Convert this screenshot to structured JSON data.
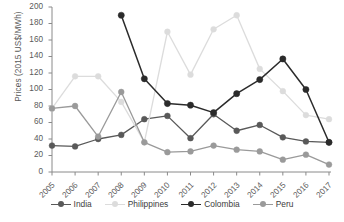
{
  "chart_data": {
    "type": "line",
    "title": "",
    "subtitle": "",
    "xlabel": "",
    "ylabel": "Prices (2015 US$/MWh)",
    "categories": [
      "2005",
      "2006",
      "2007",
      "2008",
      "2009",
      "2010",
      "2011",
      "2012",
      "2013",
      "2014",
      "2015",
      "2016",
      "2017"
    ],
    "x": [
      2005,
      2006,
      2007,
      2008,
      2009,
      2010,
      2011,
      2012,
      2013,
      2014,
      2015,
      2016,
      2017
    ],
    "ylim": [
      0,
      200
    ],
    "xlim": [
      2005,
      2017
    ],
    "yticks": [
      0,
      20,
      40,
      60,
      80,
      100,
      120,
      140,
      160,
      180,
      200
    ],
    "ytick_labels": [
      "0",
      "20",
      "40",
      "60",
      "80",
      "100",
      "120",
      "140",
      "160",
      "180",
      "200"
    ],
    "grid": false,
    "legend_position": "bottom",
    "marker": "circle",
    "series": [
      {
        "name": "India",
        "color": "#595959",
        "values": [
          32,
          31,
          40,
          45,
          64,
          68,
          41,
          70,
          50,
          57,
          42,
          37,
          36
        ]
      },
      {
        "name": "Philippines",
        "color": "#dcdcdc",
        "values": [
          77,
          116,
          116,
          85,
          36,
          170,
          118,
          173,
          190,
          125,
          98,
          69,
          64
        ]
      },
      {
        "name": "Colombia",
        "color": "#2b2b2b",
        "values": [
          null,
          null,
          null,
          190,
          113,
          83,
          81,
          72,
          95,
          112,
          137,
          100,
          36
        ]
      },
      {
        "name": "Peru",
        "color": "#9a9a9a",
        "values": [
          77,
          80,
          43,
          97,
          36,
          24,
          25,
          32,
          27,
          25,
          15,
          21,
          9
        ]
      }
    ]
  },
  "legend": {
    "items": [
      {
        "label": "India",
        "color": "#595959"
      },
      {
        "label": "Philippines",
        "color": "#dcdcdc"
      },
      {
        "label": "Colombia",
        "color": "#2b2b2b"
      },
      {
        "label": "Peru",
        "color": "#9a9a9a"
      }
    ]
  },
  "axis": {
    "y_title": "Prices (2015 US$/MWh)",
    "axis_color": "#8a8a8a"
  }
}
